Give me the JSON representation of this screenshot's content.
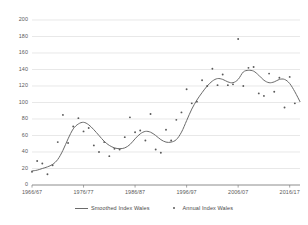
{
  "chart_data": {
    "type": "line",
    "title": "",
    "xlabel": "",
    "ylabel": "WdIS Index",
    "ylim": [
      0,
      200
    ],
    "ytick_values": [
      200,
      180,
      160,
      140,
      120,
      100,
      80,
      60,
      40,
      20,
      0
    ],
    "xtick_labels": [
      "1966/67",
      "1976/77",
      "1986/87",
      "1996/97",
      "2006/07",
      "2016/17"
    ],
    "xtick_years": [
      1966,
      1976,
      1986,
      1996,
      2006,
      2016
    ],
    "xlim": [
      1966,
      2018
    ],
    "grid": "horizontal",
    "legend_position": "bottom",
    "series": [
      {
        "name": "Smoothed Index Wales",
        "type": "line",
        "color": "#6b6b6b",
        "x": [
          1966,
          1967,
          1968,
          1969,
          1970,
          1971,
          1972,
          1973,
          1974,
          1975,
          1976,
          1977,
          1978,
          1979,
          1980,
          1981,
          1982,
          1983,
          1984,
          1985,
          1986,
          1987,
          1988,
          1989,
          1990,
          1991,
          1992,
          1993,
          1994,
          1995,
          1996,
          1997,
          1998,
          1999,
          2000,
          2001,
          2002,
          2003,
          2004,
          2005,
          2006,
          2007,
          2008,
          2009,
          2010,
          2011,
          2012,
          2013,
          2014,
          2015,
          2016,
          2017,
          2018
        ],
        "values": [
          17,
          18,
          20,
          22,
          25,
          31,
          42,
          56,
          68,
          74,
          76,
          73,
          67,
          60,
          53,
          48,
          45,
          44,
          45,
          49,
          56,
          62,
          65,
          64,
          60,
          55,
          52,
          52,
          55,
          64,
          78,
          92,
          103,
          112,
          120,
          126,
          129,
          128,
          125,
          124,
          128,
          137,
          139,
          138,
          133,
          127,
          124,
          125,
          128,
          128,
          123,
          113,
          101
        ]
      },
      {
        "name": "Annual Index Wales",
        "type": "scatter",
        "color": "#5a5a5a",
        "x": [
          1966,
          1967,
          1968,
          1969,
          1970,
          1971,
          1972,
          1973,
          1974,
          1975,
          1976,
          1977,
          1978,
          1979,
          1980,
          1981,
          1982,
          1983,
          1984,
          1985,
          1986,
          1987,
          1988,
          1989,
          1990,
          1991,
          1992,
          1993,
          1994,
          1995,
          1996,
          1997,
          1998,
          1999,
          2000,
          2001,
          2002,
          2003,
          2004,
          2005,
          2006,
          2007,
          2008,
          2009,
          2010,
          2011,
          2012,
          2013,
          2014,
          2015,
          2016,
          2017
        ],
        "values": [
          16,
          29,
          26,
          13,
          24,
          52,
          85,
          51,
          71,
          81,
          65,
          69,
          48,
          40,
          52,
          35,
          44,
          43,
          58,
          82,
          64,
          66,
          54,
          86,
          43,
          39,
          67,
          54,
          79,
          88,
          116,
          99,
          101,
          127,
          120,
          141,
          121,
          134,
          121,
          122,
          177,
          120,
          142,
          143,
          111,
          108,
          135,
          113,
          130,
          94,
          131,
          99
        ]
      }
    ]
  },
  "legend": {
    "smoothed_label": "Smoothed Index Wales",
    "annual_label": "Annual Index Wales"
  }
}
